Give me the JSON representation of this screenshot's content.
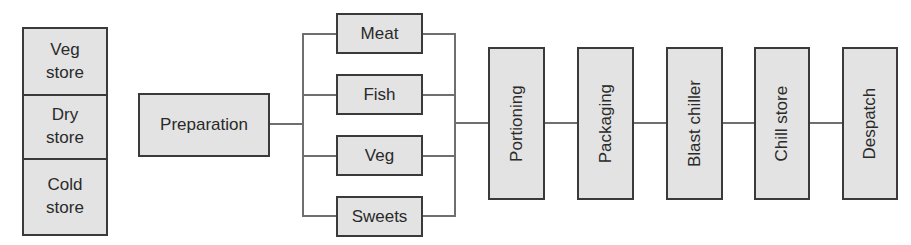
{
  "diagram": {
    "type": "process-flow",
    "colors": {
      "box_fill": "#e3e3e3",
      "box_border": "#3a3a3a",
      "connector": "#6f6f6f",
      "text": "#2a2a2a"
    },
    "stores": [
      {
        "label": "Veg\nstore"
      },
      {
        "label": "Dry\nstore"
      },
      {
        "label": "Cold\nstore"
      }
    ],
    "preparation": {
      "label": "Preparation"
    },
    "branches": [
      {
        "label": "Meat"
      },
      {
        "label": "Fish"
      },
      {
        "label": "Veg"
      },
      {
        "label": "Sweets"
      }
    ],
    "sequence": [
      {
        "label": "Portioning"
      },
      {
        "label": "Packaging"
      },
      {
        "label": "Blast chiller"
      },
      {
        "label": "Chill store"
      },
      {
        "label": "Despatch"
      }
    ],
    "edges": [
      {
        "from": "Preparation",
        "to": [
          "Meat",
          "Fish",
          "Veg",
          "Sweets"
        ]
      },
      {
        "from": [
          "Meat",
          "Fish",
          "Veg",
          "Sweets"
        ],
        "to": "Portioning"
      },
      {
        "from": "Portioning",
        "to": "Packaging"
      },
      {
        "from": "Packaging",
        "to": "Blast chiller"
      },
      {
        "from": "Blast chiller",
        "to": "Chill store"
      },
      {
        "from": "Chill store",
        "to": "Despatch"
      }
    ]
  }
}
